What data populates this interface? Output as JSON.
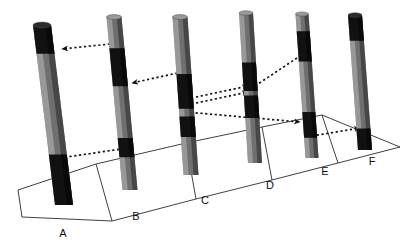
{
  "figure": {
    "background_color": "#ffffff",
    "line_color": "#111111",
    "core_body_color": "#6f6f6f",
    "core_band_color": "#111111",
    "core_highlight_color": "#b9b9b9",
    "core_shadow_color": "#3a3a3a",
    "ground_line_color": "#2a2a2a"
  },
  "ground_plane": {
    "name": "perspective-ground-plane",
    "outline": "18,190 96,164 186,143 262,127 322,115 400,147 338,163 272,180 196,199 112,221 22,217",
    "front_left": [
      18,
      190
    ],
    "front_right": [
      400,
      147
    ],
    "cells": 6,
    "divider_lines": [
      "18,190 22,217",
      "96,164 112,221",
      "186,143 196,199",
      "262,127 272,180",
      "322,115 338,163",
      "400,147 400,147"
    ]
  },
  "cores": [
    {
      "id": "A",
      "label": "A",
      "label_x": 63,
      "label_y": 237,
      "top_x": 42,
      "top_y": 25,
      "bottom_x": 64,
      "bottom_y": 205,
      "width": 18,
      "bands": [
        {
          "name": "marker-bed-top",
          "from": 0.0,
          "to": 0.16
        },
        {
          "name": "marker-bed-lower",
          "from": 0.72,
          "to": 1.0
        }
      ]
    },
    {
      "id": "B",
      "label": "B",
      "label_x": 136,
      "label_y": 220,
      "top_x": 114,
      "top_y": 17,
      "bottom_x": 130,
      "bottom_y": 190,
      "width": 15,
      "bands": [
        {
          "name": "marker-bed-upper",
          "from": 0.18,
          "to": 0.4
        },
        {
          "name": "marker-bed-lower",
          "from": 0.7,
          "to": 0.81
        }
      ]
    },
    {
      "id": "C",
      "label": "C",
      "label_x": 205,
      "label_y": 204,
      "top_x": 180,
      "top_y": 17,
      "bottom_x": 191,
      "bottom_y": 175,
      "width": 15,
      "bands": [
        {
          "name": "marker-bed-upper",
          "from": 0.36,
          "to": 0.58
        },
        {
          "name": "marker-bed-lower",
          "from": 0.63,
          "to": 0.76
        }
      ]
    },
    {
      "id": "D",
      "label": "D",
      "label_x": 270,
      "label_y": 189,
      "top_x": 246,
      "top_y": 13,
      "bottom_x": 255,
      "bottom_y": 163,
      "width": 14,
      "bands": [
        {
          "name": "marker-bed-upper",
          "from": 0.33,
          "to": 0.52
        },
        {
          "name": "marker-bed-lower",
          "from": 0.55,
          "to": 0.7
        }
      ]
    },
    {
      "id": "E",
      "label": "E",
      "label_x": 325,
      "label_y": 175,
      "top_x": 302,
      "top_y": 14,
      "bottom_x": 312,
      "bottom_y": 158,
      "width": 13,
      "bands": [
        {
          "name": "marker-bed-upper",
          "from": 0.12,
          "to": 0.33
        },
        {
          "name": "marker-bed-lower",
          "from": 0.68,
          "to": 0.86
        }
      ]
    },
    {
      "id": "F",
      "label": "F",
      "label_x": 372,
      "label_y": 165,
      "top_x": 355,
      "top_y": 15,
      "bottom_x": 365,
      "bottom_y": 150,
      "width": 14,
      "bands": [
        {
          "name": "marker-bed-top",
          "from": 0.0,
          "to": 0.19
        },
        {
          "name": "marker-bed-lower",
          "from": 0.84,
          "to": 1.0
        }
      ]
    }
  ],
  "correlation_arrows": [
    {
      "name": "arrow-b-to-a-upper",
      "from": [
        110,
        44
      ],
      "to": [
        62,
        49
      ],
      "direction": "left"
    },
    {
      "name": "arrow-c-to-b-upper",
      "from": [
        182,
        72
      ],
      "to": [
        132,
        83
      ],
      "direction": "left"
    },
    {
      "name": "arrow-d-to-c-upper",
      "from": [
        196,
        97
      ],
      "to": [
        248,
        86
      ],
      "direction": "right"
    },
    {
      "name": "arrow-e-to-d-upper",
      "from": [
        196,
        103
      ],
      "to": [
        248,
        92
      ],
      "direction": "right"
    },
    {
      "name": "arrow-e-upper-left",
      "from": [
        297,
        58
      ],
      "to": [
        249,
        90
      ],
      "direction": "left"
    },
    {
      "name": "arrow-a-to-b-lower",
      "from": [
        60,
        158
      ],
      "to": [
        128,
        148
      ],
      "direction": "right"
    },
    {
      "name": "arrow-c-to-e-lower",
      "from": [
        186,
        112
      ],
      "to": [
        300,
        122
      ],
      "direction": "left"
    },
    {
      "name": "arrow-e-to-f-lower",
      "from": [
        312,
        136
      ],
      "to": [
        360,
        128
      ],
      "direction": "right"
    }
  ]
}
